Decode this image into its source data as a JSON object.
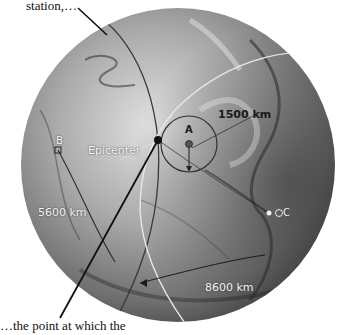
{
  "captions": {
    "top": "station,…",
    "bottom": "…the point at which the"
  },
  "globe": {
    "center": [
      178,
      165
    ],
    "radius": 157,
    "shade_light": "#d8d8d8",
    "shade_mid": "#8a8a8a",
    "shade_dark": "#3a3a3a"
  },
  "epicenter": {
    "label": "Epicenter",
    "position": [
      158,
      140
    ]
  },
  "stations": [
    {
      "id": "A",
      "label": "A",
      "position": [
        189,
        144
      ],
      "distance_label": "1500 km",
      "circle_radius": 28,
      "circle_color": "#333333"
    },
    {
      "id": "B",
      "label": "B",
      "position": [
        58,
        150
      ],
      "distance_label": "5600 km",
      "circle_color": "#333333"
    },
    {
      "id": "C",
      "label": "C",
      "position": [
        269,
        213
      ],
      "distance_label": "8600 km",
      "circle_color": "#e8e8e8"
    }
  ]
}
